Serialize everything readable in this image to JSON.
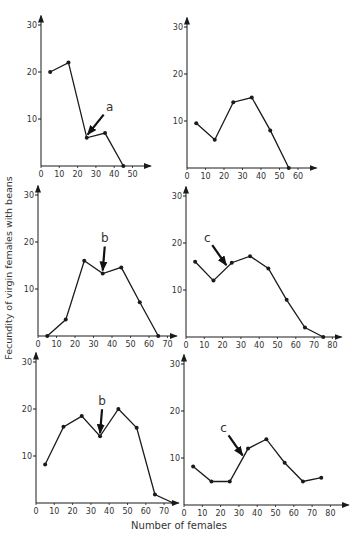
{
  "figure": {
    "ylabel": "Fecundity of virgin females with beans",
    "xlabel": "Number of females",
    "ink_color": "#1a1a1a"
  },
  "chart_data": [
    {
      "type": "line",
      "panel": "top-left",
      "annotation": "a",
      "annotation_at_x": 25.5,
      "x": [
        5,
        15,
        25,
        35,
        45
      ],
      "values": [
        20,
        22,
        6,
        7,
        0
      ],
      "xticks": [
        "0",
        "10",
        "20",
        "30",
        "40",
        "50"
      ],
      "yticks": [
        "10",
        "20",
        "30"
      ],
      "xlim": [
        0,
        60
      ],
      "ylim": [
        0,
        30
      ],
      "px": {
        "x0": 41,
        "xunit": 1.83,
        "y0": 166,
        "yunit": 4.7
      }
    },
    {
      "type": "line",
      "panel": "top-right",
      "annotation": "",
      "x": [
        5,
        15,
        25,
        35,
        45,
        55
      ],
      "values": [
        9.5,
        6,
        14,
        15,
        8,
        0
      ],
      "xticks": [
        "0",
        "10",
        "20",
        "30",
        "40",
        "50",
        "60"
      ],
      "yticks": [
        "10",
        "20",
        "30"
      ],
      "xlim": [
        0,
        70
      ],
      "ylim": [
        0,
        30
      ],
      "px": {
        "x0": 187,
        "xunit": 1.85,
        "y0": 168,
        "yunit": 4.7
      }
    },
    {
      "type": "line",
      "panel": "middle-left",
      "annotation": "b",
      "annotation_at_x": 35,
      "x": [
        5,
        15,
        25,
        35,
        45,
        55,
        65
      ],
      "values": [
        0,
        3.5,
        16,
        13.3,
        14.6,
        7.2,
        0
      ],
      "xticks": [
        "0",
        "10",
        "20",
        "30",
        "40",
        "50",
        "60",
        "70"
      ],
      "yticks": [
        "10",
        "20",
        "30"
      ],
      "xlim": [
        0,
        75
      ],
      "ylim": [
        0,
        30
      ],
      "px": {
        "x0": 38,
        "xunit": 1.85,
        "y0": 336,
        "yunit": 4.7
      }
    },
    {
      "type": "line",
      "panel": "middle-right",
      "annotation": "c",
      "annotation_at_x": 22,
      "x": [
        5,
        15,
        25,
        35,
        45,
        55,
        65,
        75
      ],
      "values": [
        16,
        12,
        15.8,
        17.2,
        14.6,
        7.9,
        2,
        0
      ],
      "xticks": [
        "0",
        "10",
        "20",
        "30",
        "40",
        "50",
        "60",
        "70",
        "80"
      ],
      "yticks": [
        "10",
        "20",
        "30"
      ],
      "xlim": [
        0,
        85
      ],
      "ylim": [
        0,
        30
      ],
      "px": {
        "x0": 186,
        "xunit": 1.83,
        "y0": 337,
        "yunit": 4.7
      }
    },
    {
      "type": "line",
      "panel": "bottom-left",
      "annotation": "b",
      "annotation_at_x": 35,
      "x": [
        5,
        15,
        25,
        35,
        45,
        55,
        65,
        75
      ],
      "values": [
        8.2,
        16.2,
        18.5,
        14.2,
        20,
        16,
        1.8,
        0
      ],
      "xticks": [
        "0",
        "10",
        "20",
        "30",
        "40",
        "50",
        "60",
        "70"
      ],
      "yticks": [
        "10",
        "20",
        "30"
      ],
      "xlim": [
        0,
        78
      ],
      "ylim": [
        0,
        30
      ],
      "px": {
        "x0": 36,
        "xunit": 1.83,
        "y0": 503,
        "yunit": 4.7
      }
    },
    {
      "type": "line",
      "panel": "bottom-right",
      "annotation": "c",
      "annotation_at_x": 32,
      "x": [
        5,
        15,
        25,
        35,
        45,
        55,
        65,
        75
      ],
      "values": [
        8.2,
        5,
        5,
        12,
        14,
        9,
        5,
        5.8
      ],
      "xticks": [
        "0",
        "10",
        "20",
        "30",
        "40",
        "50",
        "60",
        "70",
        "80"
      ],
      "yticks": [
        "10",
        "20",
        "30"
      ],
      "xlim": [
        0,
        90
      ],
      "ylim": [
        0,
        30
      ],
      "px": {
        "x0": 184,
        "xunit": 1.83,
        "y0": 505,
        "yunit": 4.7
      }
    }
  ]
}
